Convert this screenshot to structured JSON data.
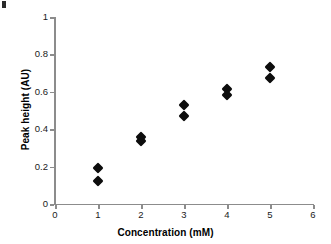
{
  "chart_data": {
    "type": "scatter",
    "title": "",
    "xlabel": "Concentration (mM)",
    "ylabel": "Peak height (AU)",
    "xlim": [
      0,
      6
    ],
    "ylim": [
      0,
      1
    ],
    "xticks": [
      "0",
      "1",
      "2",
      "3",
      "4",
      "5",
      "6"
    ],
    "xtick_values": [
      0,
      1,
      2,
      3,
      4,
      5,
      6
    ],
    "yticks": [
      "0",
      "0.2",
      "0.4",
      "0.6",
      "0.8",
      "1"
    ],
    "ytick_values": [
      0,
      0.2,
      0.4,
      0.6,
      0.8,
      1
    ],
    "grid": false,
    "legend": null,
    "marker": "diamond",
    "marker_color": "#0d0d0d",
    "axis_color": "#8c8c8c",
    "series": [
      {
        "name": "Peak height replicates",
        "points": [
          {
            "x": 1,
            "y": 0.19
          },
          {
            "x": 1,
            "y": 0.125
          },
          {
            "x": 2,
            "y": 0.36
          },
          {
            "x": 2,
            "y": 0.335
          },
          {
            "x": 3,
            "y": 0.53
          },
          {
            "x": 3,
            "y": 0.47
          },
          {
            "x": 4,
            "y": 0.615
          },
          {
            "x": 4,
            "y": 0.585
          },
          {
            "x": 5,
            "y": 0.735
          },
          {
            "x": 5,
            "y": 0.675
          }
        ]
      }
    ]
  }
}
